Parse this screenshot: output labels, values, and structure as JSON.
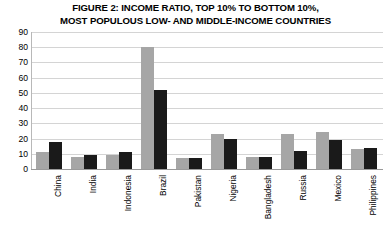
{
  "chart_data": {
    "type": "bar",
    "title": "FIGURE 2: INCOME RATIO, TOP 10% TO BOTTOM 10%, MOST POPULOUS LOW- AND MIDDLE-INCOME COUNTRIES",
    "title_lines": [
      "FIGURE 2: INCOME RATIO, TOP 10% TO BOTTOM 10%,",
      "MOST POPULOUS LOW- AND MIDDLE-INCOME COUNTRIES"
    ],
    "xlabel": "",
    "ylabel": "",
    "ylim": [
      0,
      90
    ],
    "yticks": [
      0,
      10,
      20,
      30,
      40,
      50,
      60,
      70,
      80,
      90
    ],
    "grid": true,
    "legend": false,
    "categories": [
      "China",
      "India",
      "Indonesia",
      "Brazil",
      "Pakistan",
      "Nigeria",
      "Bangladesh",
      "Russia",
      "Mexico",
      "Philippines"
    ],
    "series": [
      {
        "name": "series-a",
        "color": "#a6a6a6",
        "values": [
          11,
          8,
          9,
          80,
          7,
          23,
          8,
          23,
          24,
          13
        ]
      },
      {
        "name": "series-b",
        "color": "#1a1a1a",
        "values": [
          18,
          9,
          11,
          52,
          7,
          20,
          8,
          12,
          19,
          14
        ]
      }
    ],
    "colors": {
      "series_a": "#a6a6a6",
      "series_b": "#1a1a1a",
      "gridline": "#d4d4d4",
      "axis": "#9a9a9a",
      "text": "#000000",
      "background": "#ffffff"
    }
  }
}
